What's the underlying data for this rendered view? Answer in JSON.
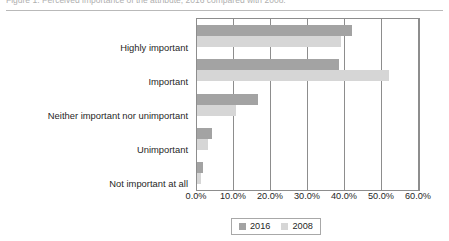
{
  "caption": {
    "text": "Figure 1.  Perceived importance of the attribute, 2016 compared with 2008."
  },
  "chart_data": {
    "type": "bar",
    "orientation": "horizontal",
    "title": "",
    "xlabel": "",
    "ylabel": "",
    "categories": [
      "Highly important",
      "Important",
      "Neither important nor unimportant",
      "Unimportant",
      "Not important at all"
    ],
    "series": [
      {
        "name": "2016",
        "color": "#a3a3a3",
        "values": [
          42.0,
          38.5,
          16.5,
          4.0,
          1.5
        ]
      },
      {
        "name": "2008",
        "color": "#d6d6d6",
        "values": [
          39.0,
          52.0,
          10.5,
          3.0,
          1.0
        ]
      }
    ],
    "xlim": [
      0,
      60
    ],
    "xtick_values": [
      0,
      10,
      20,
      30,
      40,
      50,
      60
    ],
    "xtick_labels": [
      "0.0%",
      "10.0%",
      "20.0%",
      "30.0%",
      "40.0%",
      "50.0%",
      "60.0%"
    ],
    "grid": true,
    "grid_axis": "x",
    "legend_position": "bottom-center"
  },
  "legend": {
    "entries": [
      {
        "label": "2016"
      },
      {
        "label": "2008"
      }
    ]
  },
  "colors": {
    "series_2016": "#a3a3a3",
    "series_2008": "#d6d6d6",
    "axis": "#8d8d8d",
    "text": "#1f1f1f"
  }
}
